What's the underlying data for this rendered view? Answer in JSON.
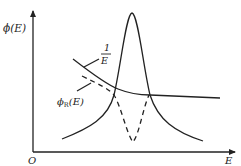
{
  "diagram": {
    "y_axis_label": "ϕ(E)",
    "x_axis_label": "E",
    "origin_label": "O",
    "curves": [
      {
        "name": "one-over-e-curve",
        "label_num": "1",
        "label_den": "E",
        "style": "solid"
      },
      {
        "name": "resonance-peak-curve",
        "style": "solid"
      },
      {
        "name": "phi-r-curve",
        "label_main": "ϕ",
        "label_sub": "R",
        "label_tail": "(E)",
        "style": "dashed"
      }
    ]
  }
}
